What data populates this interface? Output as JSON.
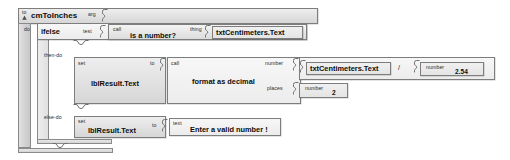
{
  "diagram": {
    "kind": "app-inventor-blocks",
    "procedure": {
      "to_label": "to",
      "name": "cmToInches",
      "arg_label": "arg",
      "do_label": "do"
    },
    "ifelse": {
      "name": "ifelse",
      "test_label": "test",
      "then_label": "then-do",
      "else_label": "else-do"
    },
    "test_call": {
      "call_label": "call",
      "name": "is a number?",
      "thing_label": "thing",
      "thing_value": "txtCentimeters.Text"
    },
    "then_branch": {
      "set_label": "set",
      "target": "lblResult.Text",
      "to_label": "to",
      "call_label": "call",
      "call_name": "format as decimal",
      "number_label": "number",
      "places_label": "places",
      "places_value_label": "number",
      "places_value": "2",
      "dividend": "txtCentimeters.Text",
      "operator": "/",
      "divisor_label": "number",
      "divisor_value": "2.54"
    },
    "else_branch": {
      "set_label": "set",
      "target": "lblResult.Text",
      "to_label": "to",
      "text_label": "text",
      "text_value": "Enter a valid number !"
    },
    "colors": {
      "block_fill": "#e9e9e9",
      "block_border": "#7d7d7d",
      "slot_fill": "#fbfbfb",
      "text": "#0d0d0d",
      "canvas": "#ffffff"
    }
  }
}
